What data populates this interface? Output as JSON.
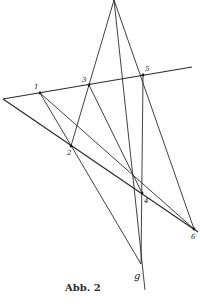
{
  "figure": {
    "caption": "Abb. 2",
    "line_label": "g",
    "line_label_pos": [
      134,
      279
    ],
    "points": [
      {
        "id": "1",
        "label": "1",
        "x": 40,
        "y": 93,
        "lx": 34,
        "ly": 89
      },
      {
        "id": "2",
        "label": "2",
        "x": 71,
        "y": 146,
        "lx": 67,
        "ly": 155
      },
      {
        "id": "3",
        "label": "3",
        "x": 89,
        "y": 85,
        "lx": 82,
        "ly": 82
      },
      {
        "id": "4",
        "label": "4",
        "x": 142,
        "y": 193,
        "lx": 144,
        "ly": 203
      },
      {
        "id": "5",
        "label": "5",
        "x": 143,
        "y": 75,
        "lx": 145,
        "ly": 71
      },
      {
        "id": "6",
        "label": "6",
        "x": 194,
        "y": 229,
        "lx": 191,
        "ly": 239
      }
    ],
    "lines": [
      {
        "name": "line-through-1-3-5",
        "x1": 3,
        "y1": 99,
        "x2": 192,
        "y2": 67,
        "thick": true
      },
      {
        "name": "line-through-2-6",
        "x1": 3,
        "y1": 99,
        "x2": 198,
        "y2": 232,
        "thick": true
      },
      {
        "name": "line-apex-3-2",
        "x1": 114,
        "y1": 0,
        "x2": 71,
        "y2": 146,
        "thick": false
      },
      {
        "name": "line-g",
        "x1": 114,
        "y1": 0,
        "x2": 145,
        "y2": 290,
        "thick": false
      },
      {
        "name": "line-apex-6",
        "x1": 114,
        "y1": 0,
        "x2": 194,
        "y2": 229,
        "thick": false
      },
      {
        "name": "line-1-2-bottom",
        "x1": 40,
        "y1": 93,
        "x2": 141,
        "y2": 264,
        "thick": false
      },
      {
        "name": "line-1-6",
        "x1": 40,
        "y1": 93,
        "x2": 194,
        "y2": 229,
        "thick": false
      },
      {
        "name": "line-3-4",
        "x1": 89,
        "y1": 85,
        "x2": 142,
        "y2": 193,
        "thick": false
      },
      {
        "name": "line-5-4-bottom",
        "x1": 143,
        "y1": 75,
        "x2": 141,
        "y2": 264,
        "thick": false
      }
    ]
  }
}
